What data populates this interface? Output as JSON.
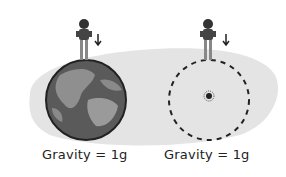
{
  "panels": [
    {
      "label": "Gravity = 1g",
      "object": "earth"
    },
    {
      "label": "Gravity = 1g",
      "object": "black-hole-dashed-sphere"
    }
  ],
  "colors": {
    "shadow": "#e4e4e4",
    "earth_ocean": "#5a5a5a",
    "earth_land": "#9a9a9a",
    "outline": "#222222"
  }
}
